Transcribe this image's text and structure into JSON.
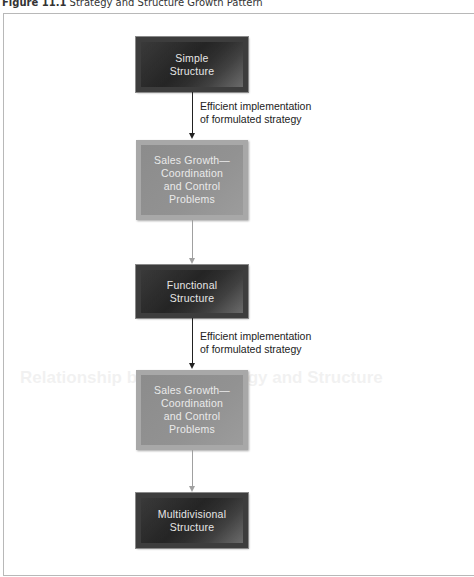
{
  "caption": {
    "figure_number": "Figure 11.1",
    "title": "Strategy and Structure Growth Pattern"
  },
  "background_showthrough": {
    "heading": "Relationship between Strategy and Structure"
  },
  "diagram": {
    "nodes": [
      {
        "id": "simple",
        "line1": "Simple",
        "line2": "Structure",
        "style": "dark"
      },
      {
        "id": "sales1",
        "line1": "Sales Growth—",
        "line2": "Coordination",
        "line3": "and Control",
        "line4": "Problems",
        "style": "light"
      },
      {
        "id": "functional",
        "line1": "Functional",
        "line2": "Structure",
        "style": "dark"
      },
      {
        "id": "sales2",
        "line1": "Sales Growth—",
        "line2": "Coordination",
        "line3": "and Control",
        "line4": "Problems",
        "style": "light"
      },
      {
        "id": "multidivisional",
        "line1": "Multidivisional",
        "line2": "Structure",
        "style": "dark"
      }
    ],
    "edges": [
      {
        "from": "simple",
        "to": "sales1",
        "label_line1": "Efficient implementation",
        "label_line2": "of formulated strategy",
        "color": "#222222"
      },
      {
        "from": "sales1",
        "to": "functional",
        "color": "#a0a0a0"
      },
      {
        "from": "functional",
        "to": "sales2",
        "label_line1": "Efficient implementation",
        "label_line2": "of formulated strategy",
        "color": "#222222"
      },
      {
        "from": "sales2",
        "to": "multidivisional",
        "color": "#a0a0a0"
      }
    ]
  }
}
